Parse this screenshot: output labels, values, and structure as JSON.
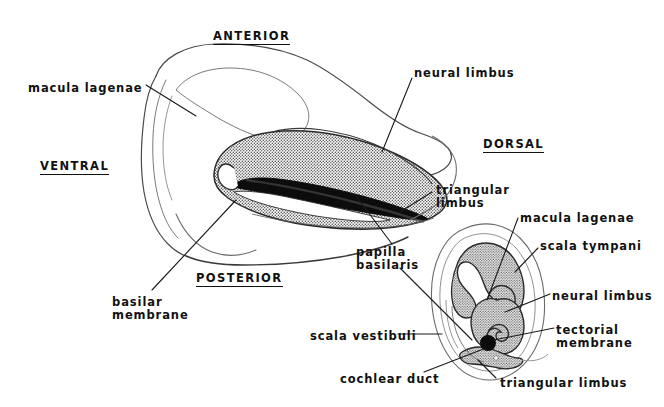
{
  "figure": {
    "kind": "anatomical-diagram",
    "subject": "cochlear duct",
    "background_color": "#ffffff",
    "ink_color": "#111111",
    "stipple_fill_color": "#9a9a9a",
    "outline_color": "#555555"
  },
  "orientation_labels": [
    {
      "id": "anterior",
      "text": "ANTERIOR",
      "x": 213,
      "y": 30
    },
    {
      "id": "ventral",
      "text": "VENTRAL",
      "x": 40,
      "y": 160
    },
    {
      "id": "dorsal",
      "text": "DORSAL",
      "x": 483,
      "y": 138
    },
    {
      "id": "posterior",
      "text": "POSTERIOR",
      "x": 196,
      "y": 272
    }
  ],
  "main_labels": [
    {
      "id": "macula-lagenae",
      "text": "macula lagenae",
      "x": 28,
      "y": 82,
      "align": "left"
    },
    {
      "id": "neural-limbus",
      "text": "neural limbus",
      "x": 414,
      "y": 67,
      "align": "left"
    },
    {
      "id": "triangular-limbus",
      "text": "triangular\nlimbus",
      "x": 436,
      "y": 184,
      "align": "left"
    },
    {
      "id": "papilla-basilaris",
      "text": "papilla\nbasilaris",
      "x": 356,
      "y": 246,
      "align": "left"
    },
    {
      "id": "basilar-membrane",
      "text": "basilar\nmembrane",
      "x": 112,
      "y": 296,
      "align": "left"
    }
  ],
  "inset_labels": [
    {
      "id": "inset-macula-lagenae",
      "text": "macula lagenae",
      "x": 520,
      "y": 212,
      "align": "left"
    },
    {
      "id": "inset-scala-tympani",
      "text": "scala tympani",
      "x": 540,
      "y": 240,
      "align": "left"
    },
    {
      "id": "inset-neural-limbus",
      "text": "neural limbus",
      "x": 552,
      "y": 290,
      "align": "left"
    },
    {
      "id": "inset-tectorial-membrane",
      "text": "tectorial\nmembrane",
      "x": 556,
      "y": 324,
      "align": "left"
    },
    {
      "id": "inset-scala-vestibuli",
      "text": "scala vestibuli",
      "x": 310,
      "y": 330,
      "align": "left"
    },
    {
      "id": "inset-cochlear-duct",
      "text": "cochlear duct",
      "x": 340,
      "y": 373,
      "align": "left"
    },
    {
      "id": "inset-triangular-limbus",
      "text": "triangular limbus",
      "x": 500,
      "y": 377,
      "align": "left"
    }
  ]
}
